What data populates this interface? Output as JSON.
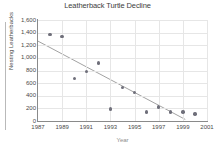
{
  "chart_data": {
    "type": "scatter",
    "title": "Leatherback Turtle Decline",
    "xlabel": "Year",
    "ylabel": "Nesting Leatherbacks",
    "xlim": [
      1987,
      2001
    ],
    "ylim": [
      0,
      1600
    ],
    "grid": true,
    "legend": "none",
    "x_ticks": [
      "1987",
      "1989",
      "1991",
      "1993",
      "1995",
      "1997",
      "1999",
      "2001"
    ],
    "x_tick_values": [
      1987,
      1989,
      1991,
      1993,
      1995,
      1997,
      1999,
      2001
    ],
    "y_ticks": [
      "0",
      "200",
      "400",
      "600",
      "800",
      "1,000",
      "1,200",
      "1,400",
      "1,600"
    ],
    "y_tick_values": [
      0,
      200,
      400,
      600,
      800,
      1000,
      1200,
      1400,
      1600
    ],
    "x": [
      1988,
      1989,
      1990,
      1991,
      1992,
      1993,
      1994,
      1995,
      1996,
      1997,
      1998,
      1999,
      2000
    ],
    "values": [
      1370,
      1340,
      670,
      780,
      920,
      190,
      530,
      450,
      140,
      220,
      140,
      140,
      110
    ],
    "points": [
      {
        "x": 1988,
        "y": 1370
      },
      {
        "x": 1989,
        "y": 1340
      },
      {
        "x": 1990,
        "y": 670
      },
      {
        "x": 1991,
        "y": 780
      },
      {
        "x": 1992,
        "y": 920
      },
      {
        "x": 1993,
        "y": 190
      },
      {
        "x": 1994,
        "y": 530
      },
      {
        "x": 1995,
        "y": 450
      },
      {
        "x": 1996,
        "y": 140
      },
      {
        "x": 1997,
        "y": 220
      },
      {
        "x": 1998,
        "y": 140
      },
      {
        "x": 1999,
        "y": 140
      },
      {
        "x": 2000,
        "y": 110
      }
    ],
    "trendline": {
      "type": "linear",
      "x_start": 1987,
      "y_start": 1265,
      "x_end": 1999.2,
      "y_end": 25
    },
    "colors": {
      "marker": "#6f6f7a",
      "trendline": "#8a8a8a",
      "grid": "#e6e6e6",
      "axis": "#8a8a8a",
      "text": "#4a4a4a",
      "background": "#ffffff"
    }
  }
}
